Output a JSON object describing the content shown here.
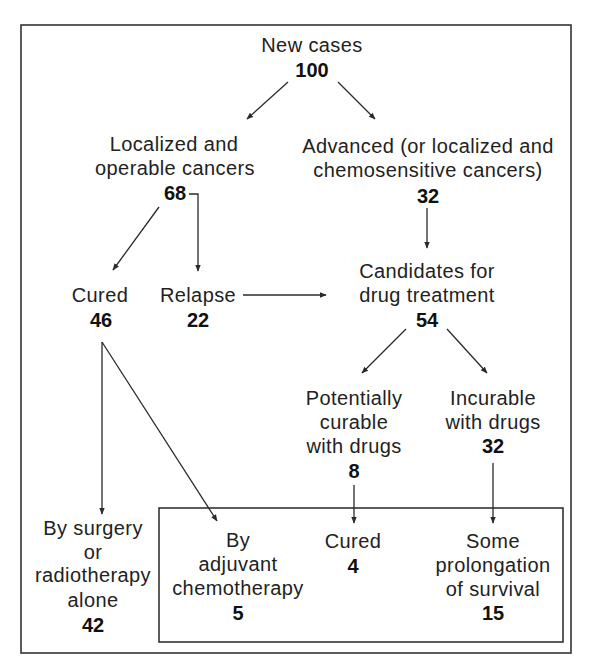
{
  "diagram": {
    "colors": {
      "line": "#2a2a2a",
      "text": "#222222",
      "background": "#ffffff"
    },
    "nodes": {
      "new_cases": {
        "label": "New cases",
        "value": "100"
      },
      "localized": {
        "lines": [
          "Localized and",
          "operable cancers"
        ],
        "value": "68"
      },
      "advanced": {
        "lines": [
          "Advanced (or localized and",
          "chemosensitive cancers)"
        ],
        "value": "32"
      },
      "cured": {
        "label": "Cured",
        "value": "46"
      },
      "relapse": {
        "label": "Relapse",
        "value": "22"
      },
      "candidates": {
        "lines": [
          "Candidates for",
          "drug treatment"
        ],
        "value": "54"
      },
      "potentially_curable": {
        "lines": [
          "Potentially",
          "curable",
          "with drugs"
        ],
        "value": "8"
      },
      "incurable": {
        "lines": [
          "Incurable",
          "with drugs"
        ],
        "value": "32"
      },
      "surgery_alone": {
        "lines": [
          "By surgery",
          "or",
          "radiotherapy",
          "alone"
        ],
        "value": "42"
      },
      "adjuvant": {
        "lines": [
          "By",
          "adjuvant",
          "chemotherapy"
        ],
        "value": "5"
      },
      "drug_cured": {
        "label": "Cured",
        "value": "4"
      },
      "prolongation": {
        "lines": [
          "Some",
          "prolongation",
          "of survival"
        ],
        "value": "15"
      }
    },
    "edges": [
      {
        "from": "new_cases",
        "to": "localized"
      },
      {
        "from": "new_cases",
        "to": "advanced"
      },
      {
        "from": "localized",
        "to": "cured"
      },
      {
        "from": "localized",
        "to": "relapse"
      },
      {
        "from": "advanced",
        "to": "candidates"
      },
      {
        "from": "relapse",
        "to": "candidates"
      },
      {
        "from": "candidates",
        "to": "potentially_curable"
      },
      {
        "from": "candidates",
        "to": "incurable"
      },
      {
        "from": "cured",
        "to": "surgery_alone"
      },
      {
        "from": "cured",
        "to": "adjuvant"
      },
      {
        "from": "potentially_curable",
        "to": "drug_cured"
      },
      {
        "from": "incurable",
        "to": "prolongation"
      }
    ]
  }
}
